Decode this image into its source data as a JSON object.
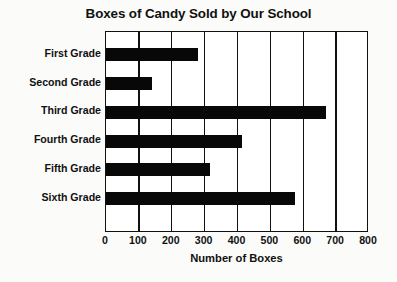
{
  "chart_data": {
    "type": "bar",
    "orientation": "horizontal",
    "title": "Boxes of Candy Sold by Our School",
    "xlabel": "Number of Boxes",
    "ylabel": "",
    "categories": [
      "First Grade",
      "Second Grade",
      "Third Grade",
      "Fourth Grade",
      "Fifth Grade",
      "Sixth Grade"
    ],
    "values": [
      280,
      140,
      670,
      415,
      315,
      575
    ],
    "xlim": [
      0,
      800
    ],
    "xticks": [
      0,
      100,
      200,
      300,
      400,
      500,
      600,
      700,
      800
    ],
    "xtick_labels": [
      "0",
      "100",
      "200",
      "300",
      "400",
      "500",
      "600",
      "700",
      "800"
    ],
    "grid": "vertical",
    "legend": "none",
    "bar_color": "#080808",
    "frame_color": "#111111",
    "background": "#ffffff"
  }
}
